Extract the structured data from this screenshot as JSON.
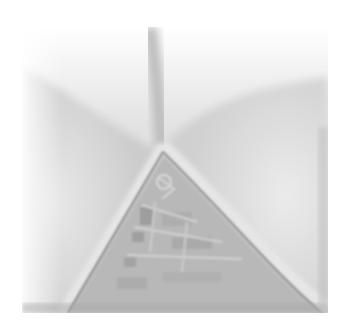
{
  "image": {
    "description": "Grayscale micrograph showing a V-shaped pale membrane fold with a textured triangular cell region at the bottom center",
    "colors": {
      "background": "#ffffff",
      "fold_light": "#efefef",
      "fold_mid": "#cfcfcf",
      "fold_shadow": "#9a9a9a",
      "texture_dark": "#8f8f8f",
      "texture_light": "#c4c4c4"
    }
  }
}
